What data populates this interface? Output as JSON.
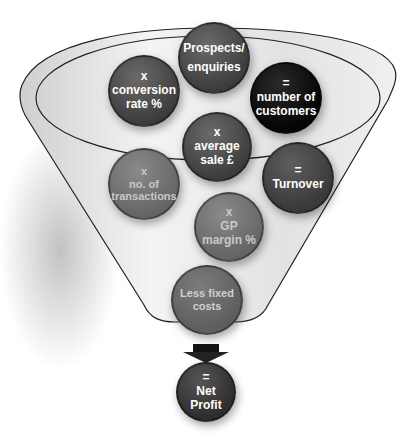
{
  "diagram": {
    "type": "funnel",
    "nodes": [
      {
        "id": "prospects",
        "lines": [
          "Prospects/",
          "enquiries"
        ],
        "tone": "dark"
      },
      {
        "id": "conversion",
        "lines": [
          "x",
          "conversion",
          "rate %"
        ],
        "tone": "dark"
      },
      {
        "id": "customers",
        "lines": [
          "=",
          "number of",
          "customers"
        ],
        "tone": "black"
      },
      {
        "id": "average-sale",
        "lines": [
          "x",
          "average",
          "sale £"
        ],
        "tone": "dark"
      },
      {
        "id": "transactions",
        "lines": [
          "x",
          "no. of",
          "transactions"
        ],
        "tone": "faded"
      },
      {
        "id": "turnover",
        "lines": [
          "=",
          "Turnover"
        ],
        "tone": "dark-faded"
      },
      {
        "id": "gp-margin",
        "lines": [
          "x",
          "GP",
          "margin %"
        ],
        "tone": "faded"
      },
      {
        "id": "fixed-costs",
        "lines": [
          "Less fixed",
          "costs"
        ],
        "tone": "faded"
      },
      {
        "id": "net-profit",
        "lines": [
          "=",
          "Net",
          "Profit"
        ],
        "tone": "dark"
      }
    ],
    "colors": {
      "dark": "#474747",
      "black": "#0a0a0a",
      "faded": "#6e6e6e",
      "funnel_fill": "#e6e6e6",
      "outline": "#222222"
    }
  }
}
